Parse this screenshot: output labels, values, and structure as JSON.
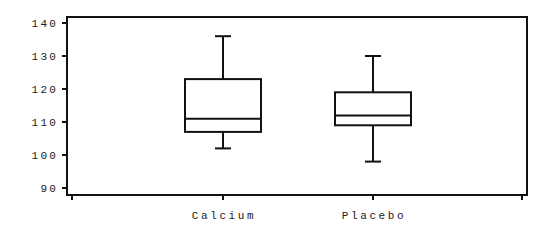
{
  "chart_data": {
    "type": "boxplot",
    "title": "",
    "xlabel": "",
    "ylabel": "",
    "ylim": [
      90,
      140
    ],
    "yticks": [
      90,
      100,
      110,
      120,
      130,
      140
    ],
    "grid": false,
    "legend": null,
    "categories": [
      "Calcium",
      "Placebo"
    ],
    "series": [
      {
        "name": "Calcium",
        "min": 102,
        "q1": 107,
        "median": 111,
        "q3": 123,
        "max": 136
      },
      {
        "name": "Placebo",
        "min": 98,
        "q1": 109,
        "median": 112,
        "q3": 119,
        "max": 130
      }
    ]
  },
  "colors": {
    "line": "#111111",
    "background": "#ffffff",
    "text": "#222222"
  }
}
